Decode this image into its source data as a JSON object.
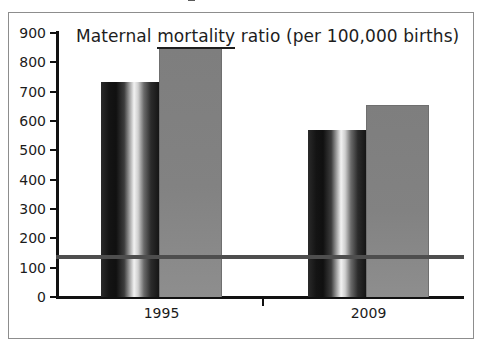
{
  "figure": {
    "width": 483,
    "height": 351,
    "background": "#ffffff",
    "frame_color": "#8d8d8d",
    "axis_color": "#111111",
    "top_fragment_note": ""
  },
  "chart_data": {
    "type": "bar",
    "title": "Maternal mortality ratio (per 100,000 births)",
    "title_parts": {
      "before": "Maternal ",
      "underlined": "mortality",
      "after": " ratio (per 100,000 births)"
    },
    "xlabel": "",
    "ylabel": "",
    "categories": [
      "1995",
      "2009"
    ],
    "ylim": [
      0,
      900
    ],
    "ytick_step": 100,
    "yticks": [
      "900",
      "800",
      "700",
      "600",
      "500",
      "400",
      "300",
      "200",
      "100",
      "0"
    ],
    "grid": false,
    "legend": "none",
    "series": [
      {
        "name": "series-1",
        "style": "cylinder-dark",
        "color": "#141414",
        "values": [
          733,
          568
        ]
      },
      {
        "name": "series-2",
        "style": "flat-grey",
        "color": "#828282",
        "values": [
          850,
          655
        ]
      }
    ],
    "annotations": [
      {
        "name": "target-reference-line",
        "type": "hline",
        "value": 135,
        "color": "#4e4e4e"
      }
    ]
  }
}
